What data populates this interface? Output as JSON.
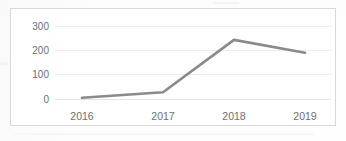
{
  "chart_data": {
    "type": "line",
    "title": "",
    "subtitle": "",
    "xlabel": "",
    "ylabel": "",
    "categories": [
      "2016",
      "2017",
      "2018",
      "2019"
    ],
    "x": [
      2016,
      2017,
      2018,
      2019
    ],
    "series": [
      {
        "name": "",
        "values": [
          5,
          28,
          243,
          190
        ]
      }
    ],
    "values": [
      5,
      28,
      243,
      190
    ],
    "ylim": [
      0,
      300
    ],
    "yticks": [
      0,
      100,
      200,
      300
    ],
    "ytick_labels": [
      "0",
      "100",
      "200",
      "300"
    ],
    "xtick_labels": [
      "2016",
      "2017",
      "2018",
      "2019"
    ],
    "grid": true,
    "grid_axis": "y",
    "legend": false,
    "legend_position": "none",
    "annotations": [],
    "colors": {
      "line": "#8a8a8a",
      "gridline": "#ededed",
      "axis": "#e3e3e3",
      "tick_text": "#6f6f6f",
      "frame_border": "#d9d9d9",
      "plot_background": "#ffffff",
      "page_background": "#fefefe"
    }
  },
  "axis": {
    "y_labels": [
      "300",
      "200",
      "100",
      "0"
    ],
    "x_labels": [
      "2016",
      "2017",
      "2018",
      "2019"
    ]
  }
}
